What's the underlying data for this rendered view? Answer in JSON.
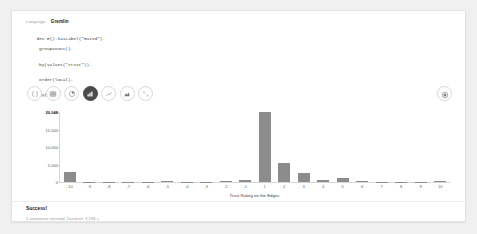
{
  "editor": {
    "language_label": "Language:",
    "language_value": "Gremlin",
    "code_lines": [
      "dev.E().hasLabel(\"Rated\").",
      "groupCount().",
      "by(values(\"trust\")).",
      "order(local).",
      "by(keys)"
    ]
  },
  "toolbar": {
    "buttons": [
      {
        "name": "code-view",
        "icon": "code-braces-icon",
        "selected": false,
        "disabled": false
      },
      {
        "name": "table-view",
        "icon": "table-icon",
        "selected": false,
        "disabled": false
      },
      {
        "name": "pie-chart-view",
        "icon": "pie-chart-icon",
        "selected": false,
        "disabled": false
      },
      {
        "name": "bar-chart-view",
        "icon": "bar-chart-icon",
        "selected": true,
        "disabled": false
      },
      {
        "name": "line-chart-view",
        "icon": "line-chart-icon",
        "selected": false,
        "disabled": false
      },
      {
        "name": "area-chart-view",
        "icon": "area-chart-icon",
        "selected": false,
        "disabled": false
      },
      {
        "name": "graph-view",
        "icon": "graph-network-icon",
        "selected": false,
        "disabled": true
      }
    ],
    "settings_icon": "gear-icon"
  },
  "chart_data": {
    "type": "bar",
    "title": "",
    "xlabel": "Trust Rating on the Edges",
    "ylabel": "",
    "ylim": [
      0,
      20048
    ],
    "grid": false,
    "legend": null,
    "bar_color": "#8c8c8c",
    "categories": [
      "-10",
      "-9",
      "-8",
      "-7",
      "-6",
      "-5",
      "-4",
      "-3",
      "-2",
      "-1",
      "1",
      "2",
      "3",
      "4",
      "5",
      "6",
      "7",
      "8",
      "9",
      "10"
    ],
    "values": [
      3000,
      60,
      50,
      60,
      120,
      180,
      140,
      130,
      320,
      480,
      20048,
      5400,
      2700,
      560,
      1250,
      170,
      110,
      90,
      80,
      260
    ],
    "ytick_labels": [
      "20,048",
      "15,000",
      "10,000",
      "5,000",
      "0"
    ],
    "ytick_values": [
      20048,
      15000,
      10000,
      5000,
      0
    ]
  },
  "footer": {
    "status": "Success!",
    "meta": "1 statement returned. Duration: 3.196 s"
  }
}
